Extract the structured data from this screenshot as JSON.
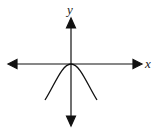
{
  "diagram": {
    "type": "function-graph",
    "function": "y = -x^2",
    "shape": "downward-opening parabola with vertex at origin",
    "axes": {
      "x_label": "x",
      "y_label": "y",
      "arrows": "both ends on both axes"
    },
    "colors": {
      "ink": "#111111",
      "background": "#ffffff"
    }
  }
}
